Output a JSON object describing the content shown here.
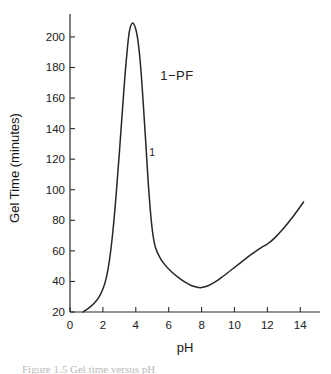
{
  "chart_data": {
    "type": "line",
    "title": "",
    "xlabel": "pH",
    "ylabel": "Gel Time (minutes)",
    "xlim": [
      0,
      15.2
    ],
    "ylim": [
      20,
      215
    ],
    "grid": false,
    "legend_position": "none",
    "xticks": [
      0,
      2,
      4,
      6,
      8,
      10,
      12,
      14
    ],
    "xtick_labels": [
      "0",
      "2",
      "4",
      "6",
      "8",
      "10",
      "12",
      "14"
    ],
    "yticks": [
      20,
      40,
      60,
      80,
      100,
      120,
      140,
      160,
      180,
      200
    ],
    "ytick_labels": [
      "20",
      "40",
      "60",
      "80",
      "100",
      "120",
      "140",
      "160",
      "180",
      "200"
    ],
    "annotations": [
      {
        "text": "1−PF",
        "x": 6.5,
        "y": 172
      },
      {
        "text": "1",
        "x": 5.0,
        "y": 122
      }
    ],
    "series": [
      {
        "name": "1-PF",
        "color": "#262626",
        "x": [
          0.8,
          1.0,
          1.25,
          1.5,
          1.75,
          2.0,
          2.2,
          2.4,
          2.6,
          2.8,
          3.0,
          3.2,
          3.4,
          3.6,
          3.8,
          4.0,
          4.15,
          4.3,
          4.45,
          4.6,
          4.8,
          5.0,
          5.2,
          5.5,
          5.8,
          6.2,
          6.6,
          7.0,
          7.4,
          7.8,
          8.0,
          8.4,
          8.8,
          9.2,
          9.8,
          10.4,
          11.0,
          11.6,
          12.0,
          12.4,
          13.0,
          13.6,
          14.2
        ],
        "y": [
          20.0,
          21.5,
          23.5,
          26.0,
          29.5,
          35.0,
          42.0,
          54.0,
          72.0,
          96.0,
          124.0,
          154.0,
          182.0,
          203.0,
          209.0,
          205.0,
          196.0,
          180.0,
          157.0,
          132.0,
          98.0,
          74.0,
          62.0,
          55.0,
          50.5,
          46.0,
          42.5,
          39.5,
          37.2,
          36.1,
          36.0,
          37.2,
          39.5,
          42.5,
          47.5,
          52.5,
          57.5,
          62.0,
          64.5,
          68.0,
          75.0,
          83.0,
          92.0
        ]
      }
    ]
  },
  "caption": {
    "text": "Figure 1.5   Gel time versus pH"
  }
}
